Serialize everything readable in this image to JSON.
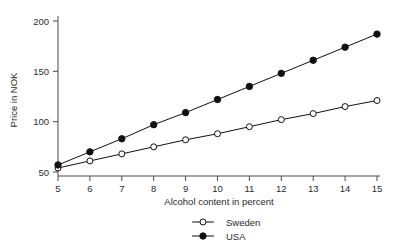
{
  "chart_data": {
    "type": "line",
    "title": "",
    "xlabel": "Alcohol content in percent",
    "ylabel": "Price in NOK",
    "x": [
      5,
      6,
      7,
      8,
      9,
      10,
      11,
      12,
      13,
      14,
      15
    ],
    "xticklabels": [
      "5",
      "6",
      "7",
      "8",
      "9",
      "10",
      "11",
      "12",
      "13",
      "14",
      "15"
    ],
    "yticks": [
      50,
      100,
      150,
      200
    ],
    "yticklabels": [
      "50",
      "100",
      "150",
      "200"
    ],
    "xlim": [
      5,
      15
    ],
    "ylim": [
      45,
      205
    ],
    "grid": false,
    "legend_position": "bottom-center",
    "series": [
      {
        "name": "Sweden",
        "marker": "open-circle",
        "color": "#111111",
        "values": [
          54,
          61,
          68,
          75,
          82,
          88,
          95,
          102,
          108,
          115,
          121
        ]
      },
      {
        "name": "USA",
        "marker": "filled-circle",
        "color": "#111111",
        "values": [
          57,
          70,
          83,
          97,
          109,
          122,
          135,
          148,
          161,
          174,
          187
        ]
      }
    ]
  },
  "legend": {
    "entries": [
      {
        "label": "Sweden"
      },
      {
        "label": "USA"
      }
    ]
  },
  "axes": {
    "x_title": "Alcohol content in percent",
    "y_title": "Price in NOK"
  }
}
